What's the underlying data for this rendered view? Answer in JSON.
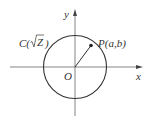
{
  "diagram": {
    "axes": {
      "x_label": "x",
      "y_label": "y",
      "origin_label": "O"
    },
    "circle_label": {
      "prefix": "C(",
      "sqrt_arg": "Z",
      "suffix": ")"
    },
    "point_label": "P(a,b)",
    "colors": {
      "stroke": "#333333",
      "axis": "#555555",
      "background": "#ffffff"
    }
  }
}
